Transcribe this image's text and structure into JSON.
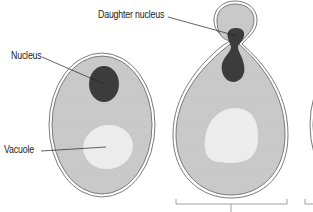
{
  "figure": {
    "type": "yeast budding diagram",
    "labels": {
      "daughter_nucleus": "Daughter nucleus",
      "nucleus": "Nucleus",
      "vacuole": "Vacuole"
    },
    "colors": {
      "cytoplasm": "#c9c9c9",
      "cell_wall": "#7a7a7a",
      "nucleus": "#3c3c3c",
      "vacuole": "#ececec",
      "leader_line": "#222222",
      "bracket": "#8a8a8a",
      "background": "#ffffff"
    },
    "cells": [
      {
        "name": "mature-cell",
        "has_nucleus": true,
        "has_vacuole": true
      },
      {
        "name": "budding-cell",
        "has_nucleus": true,
        "has_bud": true,
        "has_vacuole": true
      },
      {
        "name": "partial-cell-right",
        "cropped": true
      }
    ]
  }
}
